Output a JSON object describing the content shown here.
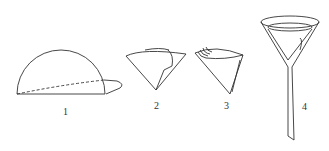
{
  "diagram": {
    "steps": [
      {
        "label": "1",
        "description": "filter paper folded in half with dashed fold line"
      },
      {
        "label": "2",
        "description": "folded into quarter cone"
      },
      {
        "label": "3",
        "description": "opened cone with layered edges"
      },
      {
        "label": "4",
        "description": "cone placed in funnel"
      }
    ]
  }
}
